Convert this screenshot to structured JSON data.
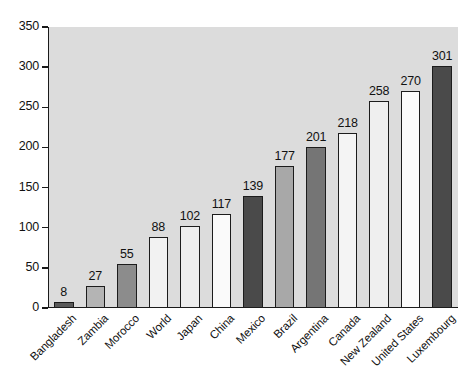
{
  "chart_data": {
    "type": "bar",
    "title": "",
    "xlabel": "",
    "ylabel": "",
    "ylim": [
      0,
      350
    ],
    "yticks": [
      0,
      50,
      100,
      150,
      200,
      250,
      300,
      350
    ],
    "grid": false,
    "legend": "none",
    "plot_background": "#dcdcdc",
    "categories": [
      "Bangladesh",
      "Zambia",
      "Morocco",
      "World",
      "Japan",
      "China",
      "Mexico",
      "Brazil",
      "Argentina",
      "Canada",
      "New Zealand",
      "United States",
      "Luxembourg"
    ],
    "values": [
      8,
      27,
      55,
      88,
      102,
      117,
      139,
      177,
      201,
      218,
      258,
      270,
      301
    ],
    "bar_colors": [
      "#5a5a5a",
      "#b4b4b4",
      "#8c8c8c",
      "#f2f2f2",
      "#ededed",
      "#fafafa",
      "#4a4a4a",
      "#a8a8a8",
      "#757575",
      "#f4f4f4",
      "#efefef",
      "#fbfbfb",
      "#4a4a4a"
    ],
    "data_labels": [
      "8",
      "27",
      "55",
      "88",
      "102",
      "117",
      "139",
      "177",
      "201",
      "218",
      "258",
      "270",
      "301"
    ],
    "ytick_labels": [
      "0",
      "50",
      "100",
      "150",
      "200",
      "250",
      "300",
      "350"
    ]
  }
}
